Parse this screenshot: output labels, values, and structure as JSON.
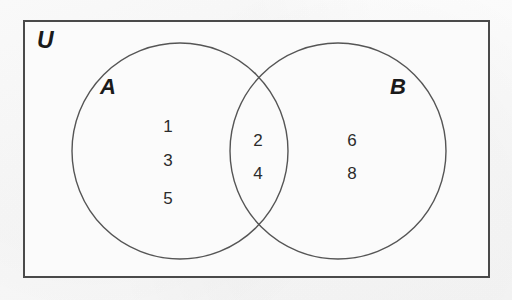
{
  "diagram": {
    "type": "venn-two-set",
    "title_label": "U",
    "universe_label": "U",
    "border_color": "#4a4a4a",
    "circle_stroke_color": "#555555",
    "text_color": "#2b2b2b",
    "background_color": "#fbfbfb",
    "sets": [
      {
        "id": "A",
        "label": "A",
        "cx": 180,
        "cy": 151,
        "r": 108,
        "only_elements": [
          "1",
          "3",
          "5"
        ]
      },
      {
        "id": "B",
        "label": "B",
        "cx": 338,
        "cy": 151,
        "r": 108,
        "only_elements": [
          "6",
          "8"
        ]
      }
    ],
    "intersection": {
      "label": "A and B",
      "elements": [
        "2",
        "4"
      ]
    },
    "outside_elements": [],
    "elements": {
      "a_only": [
        {
          "value": "1",
          "x": 168,
          "y": 118
        },
        {
          "value": "3",
          "x": 168,
          "y": 152
        },
        {
          "value": "5",
          "x": 168,
          "y": 190
        }
      ],
      "intersection": [
        {
          "value": "2",
          "x": 258,
          "y": 132
        },
        {
          "value": "4",
          "x": 258,
          "y": 165
        }
      ],
      "b_only": [
        {
          "value": "6",
          "x": 352,
          "y": 132
        },
        {
          "value": "8",
          "x": 352,
          "y": 165
        }
      ]
    }
  }
}
